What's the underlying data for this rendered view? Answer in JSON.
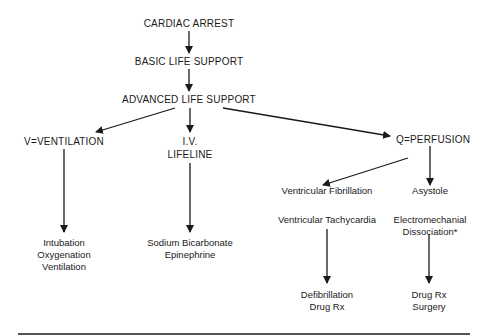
{
  "diagram": {
    "type": "flowchart",
    "nodes": {
      "cardiac_arrest": "CARDIAC ARREST",
      "basic_life_support": "BASIC LIFE SUPPORT",
      "advanced_life_support": "ADVANCED LIFE SUPPORT",
      "ventilation": "V=VENTILATION",
      "iv_lifeline_1": "I.V.",
      "iv_lifeline_2": "LIFELINE",
      "perfusion": "Q=PERFUSION",
      "vent_fib": "Ventricular Fibrillation",
      "vent_tach": "Ventricular Tachycardia",
      "asystole": "Asystole",
      "emd_1": "Electromechanial",
      "emd_2": "Dissociation*",
      "ventilation_actions": [
        "Intubation",
        "Oxygenation",
        "Ventilation"
      ],
      "iv_actions": [
        "Sodium Bicarbonate",
        "Epinephrine"
      ],
      "vf_actions": [
        "Defibrillation",
        "Drug Rx"
      ],
      "asystole_actions": [
        "Drug Rx",
        "Surgery"
      ]
    },
    "edges": [
      [
        "CARDIAC ARREST",
        "BASIC LIFE SUPPORT"
      ],
      [
        "BASIC LIFE SUPPORT",
        "ADVANCED LIFE SUPPORT"
      ],
      [
        "ADVANCED LIFE SUPPORT",
        "V=VENTILATION"
      ],
      [
        "ADVANCED LIFE SUPPORT",
        "I.V. LIFELINE"
      ],
      [
        "ADVANCED LIFE SUPPORT",
        "Q=PERFUSION"
      ],
      [
        "V=VENTILATION",
        "Intubation / Oxygenation / Ventilation"
      ],
      [
        "I.V. LIFELINE",
        "Sodium Bicarbonate / Epinephrine"
      ],
      [
        "Q=PERFUSION",
        "Ventricular Fibrillation"
      ],
      [
        "Q=PERFUSION",
        "Asystole"
      ],
      [
        "Ventricular Tachycardia",
        "Defibrillation / Drug Rx"
      ],
      [
        "Electromechanial Dissociation*",
        "Drug Rx / Surgery"
      ]
    ],
    "colors": {
      "ink": "#1a1a1a",
      "background": "#ffffff"
    }
  }
}
